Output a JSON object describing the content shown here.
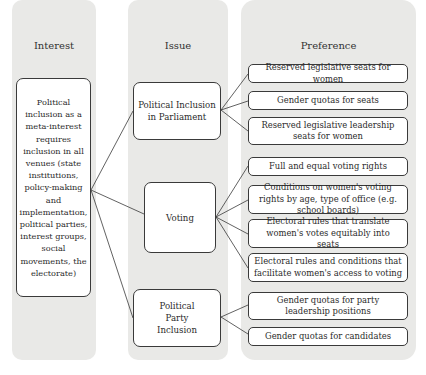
{
  "columns": {
    "interest": {
      "label": "Interest"
    },
    "issue": {
      "label": "Issue"
    },
    "preference": {
      "label": "Preference"
    }
  },
  "interest_box": {
    "text": "Political inclusion as a meta-interest requires inclusion in all venues (state institutions, policy-making and implementation, political parties, interest groups, social movements, the electorate)"
  },
  "issues": [
    {
      "label": "Political Inclusion in Parliament"
    },
    {
      "label": "Voting"
    },
    {
      "label": "Political Party Inclusion"
    }
  ],
  "preferences": [
    {
      "label": "Reserved legislative seats for women",
      "issue": 0
    },
    {
      "label": "Gender quotas for seats",
      "issue": 0
    },
    {
      "label": "Reserved legislative leadership seats for women",
      "issue": 0
    },
    {
      "label": "Full and equal voting rights",
      "issue": 1
    },
    {
      "label": "Conditions on women's voting rights by age, type of office (e.g. school boards)",
      "issue": 1
    },
    {
      "label": "Electoral rules that translate women's votes equitably into seats",
      "issue": 1
    },
    {
      "label": "Electoral rules and conditions that facilitate women's access to voting",
      "issue": 1
    },
    {
      "label": "Gender quotas for party leadership positions",
      "issue": 2
    },
    {
      "label": "Gender quotas for candidates",
      "issue": 2
    }
  ]
}
